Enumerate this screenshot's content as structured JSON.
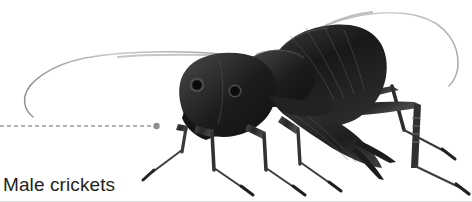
{
  "figure": {
    "caption": "Male crickets",
    "background_color": "#ffffff",
    "caption_color": "#231f20",
    "width": 472,
    "height": 202
  },
  "leader_line": {
    "name": "dashed-leader-line",
    "color": "#9a9a9a",
    "dash": "4 3",
    "stroke_width": 1.3,
    "start_x": 0,
    "end_x": 152,
    "y": 126,
    "endpoint_dot": {
      "cx": 156,
      "cy": 126,
      "r": 3.1,
      "color": "#8d8d8d"
    }
  },
  "subject": {
    "name": "cricket-illustration",
    "ink_color": "#1a1a1a",
    "mid_color": "#3a3a3a",
    "shadow_color": "#5a5a5a",
    "antenna_color": "#b4b4b4",
    "parts": [
      "left-antenna",
      "right-antenna",
      "head",
      "eye-left",
      "eye-right",
      "pronotum",
      "forewing",
      "hindwing",
      "abdomen",
      "cercus-upper",
      "cercus-lower",
      "foreleg",
      "midleg",
      "hindleg-near",
      "hindleg-far"
    ]
  },
  "bottom_rule": {
    "name": "bottom-divider",
    "color": "#d8d8d8"
  }
}
